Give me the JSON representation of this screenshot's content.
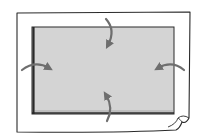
{
  "diagram": {
    "colors": {
      "background": "#ffffff",
      "outline": "#2a2a2a",
      "inner_fill": "#d4d4d4",
      "arrow": "#6e6e6e"
    },
    "outer_sheet": {
      "x": 16,
      "y": 12,
      "width": 174,
      "height": 120,
      "curled_corner": "bottom-right"
    },
    "inner_rect": {
      "x": 32,
      "y": 27,
      "width": 142,
      "height": 87
    },
    "arrows": [
      {
        "id": "top",
        "direction": "down"
      },
      {
        "id": "bottom",
        "direction": "up"
      },
      {
        "id": "left",
        "direction": "right"
      },
      {
        "id": "right",
        "direction": "left"
      }
    ]
  }
}
